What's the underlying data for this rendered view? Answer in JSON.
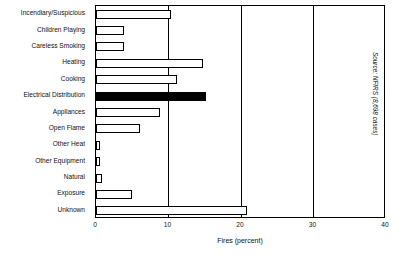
{
  "chart_data": {
    "type": "bar",
    "orientation": "horizontal",
    "title": "",
    "xlabel": "Fires (percent)",
    "ylabel": "",
    "xlim": [
      0,
      40
    ],
    "xticks": [
      0,
      10,
      20,
      30,
      40
    ],
    "grid": true,
    "legend": false,
    "source_note": "Source: NFIRS (8,698 cases)",
    "categories": [
      "Incendiary/Suspicious",
      "Children Playing",
      "Careless Smoking",
      "Heating",
      "Cooking",
      "Electrical Distribution",
      "Appliances",
      "Open Flame",
      "Other Heat",
      "Other Equipment",
      "Natural",
      "Exposure",
      "Unknown"
    ],
    "values": [
      10.3,
      3.8,
      3.8,
      14.7,
      11.2,
      15.2,
      8.8,
      6.0,
      0.5,
      0.5,
      0.8,
      5.0,
      20.8
    ],
    "highlighted": [
      "Electrical Distribution"
    ],
    "highlight_color": "#000000",
    "bar_color": "#ffffff",
    "bar_edge_color": "#000000"
  }
}
